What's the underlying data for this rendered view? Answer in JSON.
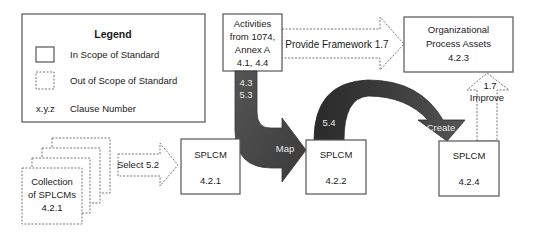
{
  "legend": {
    "title": "Legend",
    "items": [
      {
        "symbol": "solid-box",
        "label": "In Scope of Standard"
      },
      {
        "symbol": "dashed-box",
        "label": "Out of Scope of Standard"
      },
      {
        "symbol": "x.y.z",
        "label": "Clause Number"
      }
    ]
  },
  "nodes": {
    "activities": {
      "lines": [
        "Activities",
        "from 1074,",
        "Annex A",
        "4.1, 4.4"
      ],
      "scope": "in"
    },
    "org_assets": {
      "lines": [
        "Organizational",
        "Process Assets",
        "4.2.3"
      ],
      "scope": "in"
    },
    "collection": {
      "lines": [
        "Collection",
        "of SPLCMs",
        "4.2.1"
      ],
      "scope": "out"
    },
    "splcm_421": {
      "title": "SPLCM",
      "clause": "4.2.1",
      "scope": "in"
    },
    "splcm_422": {
      "title": "SPLCM",
      "clause": "4.2.2",
      "scope": "in"
    },
    "splcm_424": {
      "title": "SPLCM",
      "clause": "4.2.4",
      "scope": "in"
    }
  },
  "arrows": {
    "provide_framework": {
      "label": "Provide Framework 1.7",
      "style": "dashed-outline"
    },
    "select": {
      "label": "Select 5.2",
      "style": "dashed-outline"
    },
    "map": {
      "label": "Map",
      "clauses": [
        "4.3",
        "5.3"
      ],
      "style": "filled-dark"
    },
    "create": {
      "label": "Create",
      "clause": "5.4",
      "style": "filled-dark"
    },
    "improve": {
      "label": "Improve",
      "clause": "1.7",
      "style": "dashed-outline"
    }
  },
  "colors": {
    "arrow_fill": "#4a4a4a",
    "arrow_fill_dark": "#2e2e2e",
    "box_stroke": "#555555",
    "dashed_stroke": "#777777",
    "background": "#ffffff"
  }
}
